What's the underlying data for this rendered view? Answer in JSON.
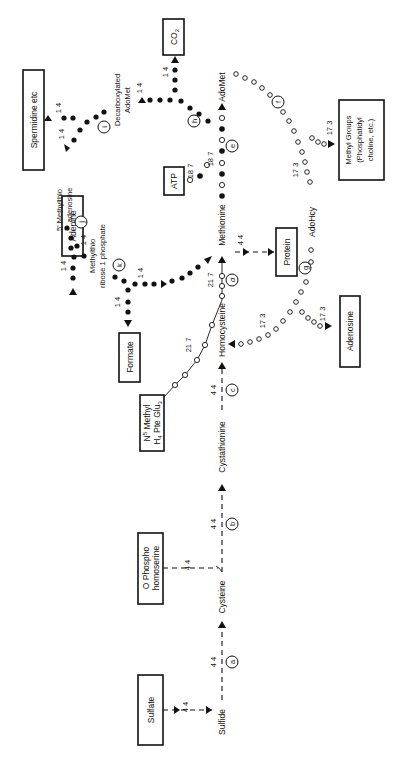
{
  "diagram": {
    "title": "",
    "orientation": "rotated 90 degrees counter-clockwise",
    "boxes": {
      "sulfate": "Sulfate",
      "o_phospho_1": "O Phospho",
      "o_phospho_2": "homoserine",
      "n5_1": "N",
      "n5_sup": "5",
      "n5_2": "Methyl",
      "n5_3": "H",
      "n5_sub": "4",
      "n5_4": "Pte Glu",
      "n5_sub2": "3",
      "formate": "Formate",
      "adenine": "Adenine",
      "spermidine": "Spermidine  etc",
      "co2": "CO",
      "co2_sub": "2",
      "atp": "ATP",
      "protein": "Protein",
      "methyl_1": "Methyl Groups",
      "methyl_2": "(Phosphatidyl",
      "methyl_3": "choline, etc.)",
      "adenosine": "Adenosine"
    },
    "metabolites": {
      "sulfide": "Sulfide",
      "cysteine": "Cysteine",
      "cystathionine": "Cystathionine",
      "homocysteine": "Homocysteine",
      "methionine": "Methionine",
      "adomet": "AdoMet",
      "adohcy": "AdoHcy",
      "decarb_1": "Decarboxylated",
      "decarb_2": "AdoMet",
      "mta_1": "5' Methylthio",
      "mta_2": "adenosine",
      "mtr_1": "Methylthio",
      "mtr_2": "ribose 1 phosphate"
    },
    "enzymes": [
      "a",
      "b",
      "c",
      "d",
      "e",
      "f",
      "g",
      "h",
      "i",
      "j",
      "k"
    ],
    "values": {
      "v44": "4 4",
      "v217": "21 7",
      "v187": "18 7",
      "v173": "17 3",
      "v14": "1 4"
    },
    "legend": {
      "dashed_line": "flux 4.4",
      "open_circles": "flux 21.7 / 18.7 / 17.3",
      "filled_dots": "flux 1.4"
    }
  }
}
